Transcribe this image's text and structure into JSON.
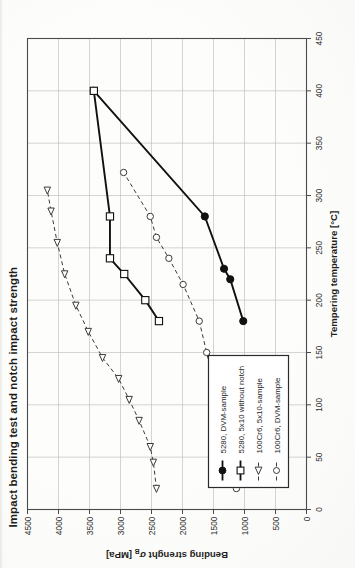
{
  "document": {
    "figure_title": "Impact bending test and notch impact strength",
    "orientation_note": "landscape figure on portrait page, rotated 90 degrees counter-clockwise"
  },
  "chart_data": {
    "type": "line",
    "title": "Impact bending test and notch impact strength",
    "xlabel": "Tempering temperature [°C]",
    "ylabel_main": "Bending strenght",
    "ylabel_symbol": "σ",
    "ylabel_subscript": "B",
    "ylabel_unit": "[MPa]",
    "xlim": [
      0,
      450
    ],
    "ylim": [
      0,
      4500
    ],
    "xticks": [
      0,
      50,
      100,
      150,
      200,
      250,
      300,
      350,
      400,
      450
    ],
    "yticks": [
      0,
      500,
      1000,
      1500,
      2000,
      2500,
      3000,
      3500,
      4000,
      4500
    ],
    "grid": true,
    "legend_position": "lower-left-inside",
    "series": [
      {
        "name": "5280, DVM-sample",
        "marker": "filled-circle",
        "line": "solid",
        "color": "#111111",
        "points": [
          {
            "x": 180,
            "y": 1020
          },
          {
            "x": 220,
            "y": 1230
          },
          {
            "x": 230,
            "y": 1330
          },
          {
            "x": 280,
            "y": 1640
          },
          {
            "x": 400,
            "y": 3430
          }
        ]
      },
      {
        "name": "5280, 5x10 without notch",
        "marker": "open-square",
        "line": "solid",
        "color": "#111111",
        "points": [
          {
            "x": 180,
            "y": 2380
          },
          {
            "x": 200,
            "y": 2600
          },
          {
            "x": 225,
            "y": 2940
          },
          {
            "x": 240,
            "y": 3170
          },
          {
            "x": 280,
            "y": 3170
          },
          {
            "x": 400,
            "y": 3430
          }
        ]
      },
      {
        "name": "100Cr6, 5x10-sample",
        "marker": "open-triangle-left",
        "line": "dashed",
        "color": "#3a3a3a",
        "points": [
          {
            "x": 20,
            "y": 2420
          },
          {
            "x": 45,
            "y": 2470
          },
          {
            "x": 60,
            "y": 2520
          },
          {
            "x": 85,
            "y": 2700
          },
          {
            "x": 105,
            "y": 2860
          },
          {
            "x": 125,
            "y": 3030
          },
          {
            "x": 145,
            "y": 3290
          },
          {
            "x": 170,
            "y": 3520
          },
          {
            "x": 195,
            "y": 3720
          },
          {
            "x": 225,
            "y": 3900
          },
          {
            "x": 255,
            "y": 4020
          },
          {
            "x": 285,
            "y": 4120
          },
          {
            "x": 305,
            "y": 4180
          }
        ]
      },
      {
        "name": "100Cr6, DVM-sample",
        "marker": "open-circle",
        "line": "dashed",
        "color": "#3a3a3a",
        "points": [
          {
            "x": 20,
            "y": 1130
          },
          {
            "x": 150,
            "y": 1610
          },
          {
            "x": 180,
            "y": 1730
          },
          {
            "x": 215,
            "y": 1990
          },
          {
            "x": 240,
            "y": 2220
          },
          {
            "x": 260,
            "y": 2420
          },
          {
            "x": 280,
            "y": 2520
          },
          {
            "x": 322,
            "y": 2950
          }
        ]
      }
    ]
  },
  "legend": {
    "entries": [
      {
        "label": "5280, DVM-sample",
        "marker": "filled-circle",
        "line": "solid"
      },
      {
        "label": "5280, 5x10 without notch",
        "marker": "open-square",
        "line": "solid"
      },
      {
        "label": "100Cr6, 5x10-sample",
        "marker": "open-triangle-left",
        "line": "dashed"
      },
      {
        "label": "100Cr6, DVM-sample",
        "marker": "open-circle",
        "line": "dashed"
      }
    ]
  }
}
